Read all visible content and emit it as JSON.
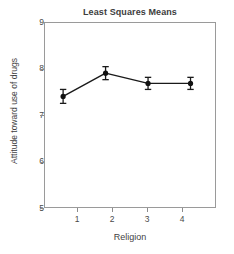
{
  "chart_data": {
    "type": "line",
    "title": "Least Squares Means",
    "xlabel": "Religion",
    "ylabel": "Attitude toward use of drugs",
    "x": [
      1,
      2,
      3,
      4
    ],
    "categories": [
      "1",
      "2",
      "3",
      "4"
    ],
    "values": [
      7.4,
      7.9,
      7.68,
      7.68
    ],
    "errors": [
      0.15,
      0.14,
      0.13,
      0.13
    ],
    "series": [
      {
        "name": "Least squares mean",
        "values": [
          7.4,
          7.9,
          7.68,
          7.68
        ],
        "errors": [
          0.15,
          0.14,
          0.13,
          0.13
        ]
      }
    ],
    "xlim": [
      0.55,
      4.6
    ],
    "ylim": [
      5,
      9
    ],
    "yticks": [
      5,
      6,
      7,
      8,
      9
    ],
    "ytick_labels": [
      "5",
      "6",
      "7",
      "8",
      "9"
    ],
    "xticks": [
      1,
      2,
      3,
      4
    ],
    "xtick_labels": [
      "1",
      "2",
      "3",
      "4"
    ],
    "grid": false,
    "legend": false,
    "marker": "filled-circle",
    "error_bar_style": "capped",
    "line_color": "#1a1a1a",
    "marker_color": "#111111",
    "axis_color": "#9a9a9a",
    "background_color": "#ffffff"
  }
}
